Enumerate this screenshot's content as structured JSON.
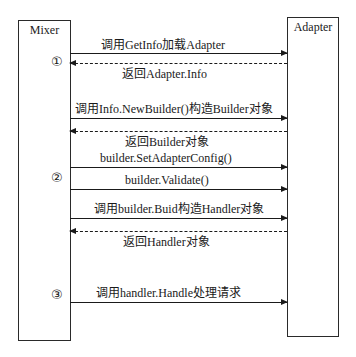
{
  "participants": {
    "left": {
      "name": "Mixer"
    },
    "right": {
      "name": "Adapter"
    }
  },
  "steps": [
    {
      "marker": "①"
    },
    {
      "marker": "②"
    },
    {
      "marker": "③"
    }
  ],
  "messages": [
    {
      "text": "调用GetInfo加载Adapter",
      "style": "solid",
      "direction": "Mixer→Adapter"
    },
    {
      "text": "返回Adapter.Info",
      "style": "dashed",
      "direction": "Adapter→Mixer"
    },
    {
      "text": "调用Info.NewBuilder()构造Builder对象",
      "style": "solid",
      "direction": "Mixer→Adapter"
    },
    {
      "text": "返回Builder对象",
      "style": "dashed",
      "direction": "Adapter→Mixer"
    },
    {
      "text": "builder.SetAdapterConfig()",
      "style": "solid",
      "direction": "Mixer→Adapter"
    },
    {
      "text": "builder.Validate()",
      "style": "solid",
      "direction": "Mixer→Adapter"
    },
    {
      "text": "调用builder.Buid构造Handler对象",
      "style": "solid",
      "direction": "Mixer→Adapter"
    },
    {
      "text": "返回Handler对象",
      "style": "dashed",
      "direction": "Adapter→Mixer"
    },
    {
      "text": "调用handler.Handle处理请求",
      "style": "solid",
      "direction": "Mixer→Adapter"
    }
  ]
}
